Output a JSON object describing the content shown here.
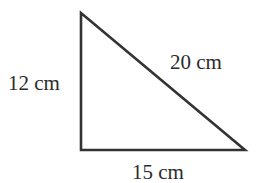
{
  "diagram": {
    "type": "right-triangle",
    "stroke_color": "#333333",
    "text_color": "#2b2b2b",
    "vertices": {
      "top": [
        81,
        13
      ],
      "bottom_left": [
        81,
        150
      ],
      "bottom_right": [
        245,
        150
      ]
    },
    "sides": {
      "vertical": {
        "label": "12 cm",
        "length": 12,
        "unit": "cm"
      },
      "hypotenuse": {
        "label": "20 cm",
        "length": 20,
        "unit": "cm"
      },
      "base": {
        "label": "15 cm",
        "length": 15,
        "unit": "cm"
      }
    }
  }
}
